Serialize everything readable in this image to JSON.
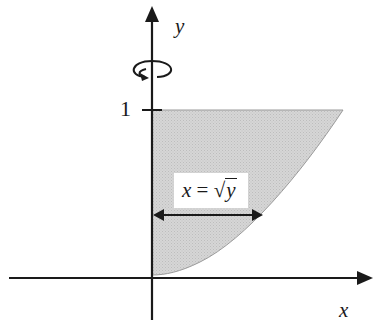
{
  "diagram": {
    "type": "solid-of-revolution-region",
    "axes": {
      "x_label": "x",
      "y_label": "y",
      "y_tick_label": "1"
    },
    "curve": {
      "equation_lhs": "x =",
      "equation_sqrt_symbol": "√",
      "equation_radicand": "y",
      "description": "x = √y"
    },
    "region": {
      "fill_color": "#cfcfcf",
      "bounds": "0 ≤ y ≤ 1, 0 ≤ x ≤ √y"
    },
    "rotation_axis": "y",
    "radius_arrow": "double-headed horizontal arrow from y-axis to curve",
    "colors": {
      "axis": "#1a1a1a",
      "shade": "#cfcfcf",
      "curve_edge": "#9a9a9a",
      "background": "#ffffff"
    }
  }
}
